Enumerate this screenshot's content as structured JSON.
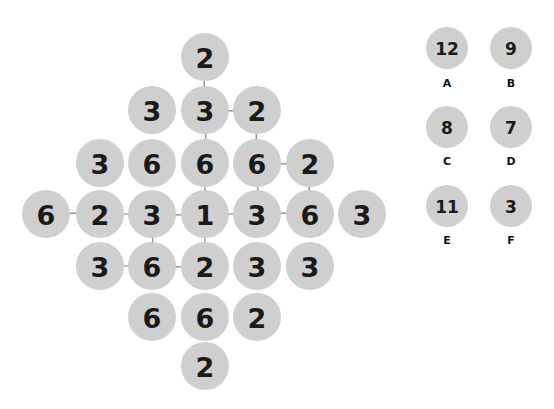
{
  "canvas": {
    "width": 554,
    "height": 409,
    "background": "#ffffff"
  },
  "style": {
    "node_fill": "#cfcfcf",
    "node_radius": 24,
    "node_text_color": "#1a1a1a",
    "link_color": "#7d7d7d",
    "legend_radius": 21,
    "legend_text_color": "#1a1a1a",
    "legend_key_color": "#111111"
  },
  "board": {
    "name": "number-grid-diamond",
    "nodes": [
      {
        "id": "n0",
        "value": "2",
        "x": 205,
        "y": 57,
        "row": 0,
        "col": 0
      },
      {
        "id": "n1",
        "value": "3",
        "x": 152,
        "y": 110,
        "row": 1,
        "col": -1
      },
      {
        "id": "n2",
        "value": "3",
        "x": 205,
        "y": 110,
        "row": 1,
        "col": 0
      },
      {
        "id": "n3",
        "value": "2",
        "x": 257,
        "y": 110,
        "row": 1,
        "col": 1
      },
      {
        "id": "n4",
        "value": "3",
        "x": 100,
        "y": 163,
        "row": 2,
        "col": -2
      },
      {
        "id": "n5",
        "value": "6",
        "x": 152,
        "y": 163,
        "row": 2,
        "col": -1
      },
      {
        "id": "n6",
        "value": "6",
        "x": 205,
        "y": 163,
        "row": 2,
        "col": 0
      },
      {
        "id": "n7",
        "value": "6",
        "x": 257,
        "y": 163,
        "row": 2,
        "col": 1
      },
      {
        "id": "n8",
        "value": "2",
        "x": 310,
        "y": 163,
        "row": 2,
        "col": 2
      },
      {
        "id": "n9",
        "value": "6",
        "x": 46,
        "y": 214,
        "row": 3,
        "col": -3
      },
      {
        "id": "n10",
        "value": "2",
        "x": 100,
        "y": 214,
        "row": 3,
        "col": -2
      },
      {
        "id": "n11",
        "value": "3",
        "x": 152,
        "y": 214,
        "row": 3,
        "col": -1
      },
      {
        "id": "n12",
        "value": "1",
        "x": 205,
        "y": 214,
        "row": 3,
        "col": 0
      },
      {
        "id": "n13",
        "value": "3",
        "x": 257,
        "y": 214,
        "row": 3,
        "col": 1
      },
      {
        "id": "n14",
        "value": "6",
        "x": 310,
        "y": 214,
        "row": 3,
        "col": 2
      },
      {
        "id": "n15",
        "value": "3",
        "x": 362,
        "y": 214,
        "row": 3,
        "col": 3
      },
      {
        "id": "n16",
        "value": "3",
        "x": 100,
        "y": 266,
        "row": 4,
        "col": -2
      },
      {
        "id": "n17",
        "value": "6",
        "x": 152,
        "y": 266,
        "row": 4,
        "col": -1
      },
      {
        "id": "n18",
        "value": "2",
        "x": 205,
        "y": 266,
        "row": 4,
        "col": 0
      },
      {
        "id": "n19",
        "value": "3",
        "x": 257,
        "y": 266,
        "row": 4,
        "col": 1
      },
      {
        "id": "n20",
        "value": "3",
        "x": 310,
        "y": 266,
        "row": 4,
        "col": 2
      },
      {
        "id": "n21",
        "value": "6",
        "x": 152,
        "y": 317,
        "row": 5,
        "col": -1
      },
      {
        "id": "n22",
        "value": "6",
        "x": 205,
        "y": 317,
        "row": 5,
        "col": 0
      },
      {
        "id": "n23",
        "value": "2",
        "x": 257,
        "y": 317,
        "row": 5,
        "col": 1
      },
      {
        "id": "n24",
        "value": "2",
        "x": 205,
        "y": 366,
        "row": 6,
        "col": 0
      }
    ],
    "links": [
      {
        "from": "n0",
        "to": "n2"
      },
      {
        "from": "n2",
        "to": "n3"
      },
      {
        "from": "n2",
        "to": "n6"
      },
      {
        "from": "n3",
        "to": "n7"
      },
      {
        "from": "n7",
        "to": "n8"
      },
      {
        "from": "n7",
        "to": "n13"
      },
      {
        "from": "n8",
        "to": "n14"
      },
      {
        "from": "n6",
        "to": "n12"
      },
      {
        "from": "n9",
        "to": "n10"
      },
      {
        "from": "n10",
        "to": "n11"
      },
      {
        "from": "n11",
        "to": "n12"
      },
      {
        "from": "n11",
        "to": "n17"
      },
      {
        "from": "n12",
        "to": "n13"
      },
      {
        "from": "n12",
        "to": "n18"
      },
      {
        "from": "n13",
        "to": "n14"
      },
      {
        "from": "n16",
        "to": "n17"
      },
      {
        "from": "n17",
        "to": "n18"
      }
    ]
  },
  "legend": {
    "name": "value-legend",
    "items": [
      {
        "key": "A",
        "value": "12",
        "cx": 447,
        "cy": 48,
        "label_y": 83
      },
      {
        "key": "B",
        "value": "9",
        "cx": 511,
        "cy": 48,
        "label_y": 83
      },
      {
        "key": "C",
        "value": "8",
        "cx": 447,
        "cy": 127,
        "label_y": 161
      },
      {
        "key": "D",
        "value": "7",
        "cx": 511,
        "cy": 127,
        "label_y": 161
      },
      {
        "key": "E",
        "value": "11",
        "cx": 447,
        "cy": 206,
        "label_y": 240
      },
      {
        "key": "F",
        "value": "3",
        "cx": 511,
        "cy": 206,
        "label_y": 240
      }
    ]
  }
}
